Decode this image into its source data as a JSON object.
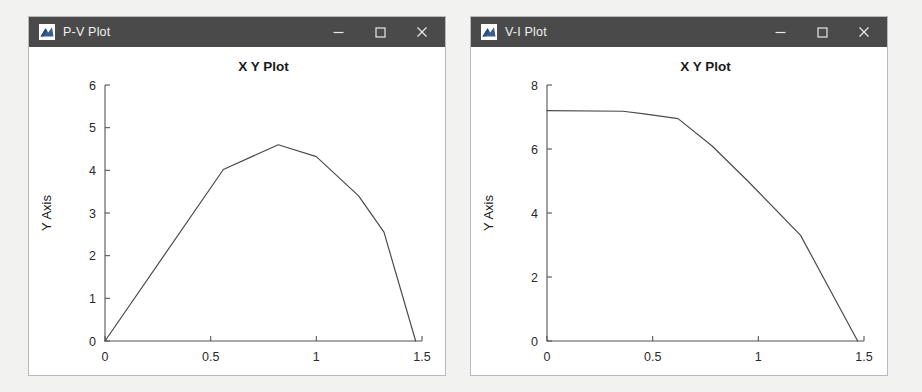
{
  "page": {
    "background_color": "#f2f2f0"
  },
  "windows": [
    {
      "id": "pv",
      "title": "P-V Plot",
      "icon": "matlab-figure-icon",
      "controls": {
        "minimize": "minimize-icon",
        "maximize": "maximize-icon",
        "close": "close-icon"
      },
      "titlebar_color": "#4a4a4a"
    },
    {
      "id": "vi",
      "title": "V-I Plot",
      "icon": "matlab-figure-icon",
      "controls": {
        "minimize": "minimize-icon",
        "maximize": "maximize-icon",
        "close": "close-icon"
      },
      "titlebar_color": "#4a4a4a"
    }
  ],
  "chart_data": [
    {
      "type": "line",
      "window": "P-V Plot",
      "title": "X Y Plot",
      "xlabel": "X Axis",
      "ylabel": "Y Axis",
      "xlim": [
        0,
        1.5
      ],
      "ylim": [
        0,
        6
      ],
      "xticks": [
        0,
        0.5,
        1,
        1.5
      ],
      "xtick_labels": [
        "0",
        "0.5",
        "1",
        "1.5"
      ],
      "yticks": [
        0,
        1,
        2,
        3,
        4,
        5,
        6
      ],
      "ytick_labels": [
        "0",
        "1",
        "2",
        "3",
        "4",
        "5",
        "6"
      ],
      "grid": false,
      "legend": false,
      "line_color": "#4b4b4b",
      "x": [
        0,
        0.56,
        0.82,
        1.0,
        1.2,
        1.32,
        1.47
      ],
      "y": [
        0,
        4.02,
        4.6,
        4.32,
        3.4,
        2.55,
        0
      ]
    },
    {
      "type": "line",
      "window": "V-I Plot",
      "title": "X Y Plot",
      "xlabel": "X Axis",
      "ylabel": "Y Axis",
      "xlim": [
        0,
        1.5
      ],
      "ylim": [
        0,
        8
      ],
      "xticks": [
        0,
        0.5,
        1,
        1.5
      ],
      "xtick_labels": [
        "0",
        "0.5",
        "1",
        "1.5"
      ],
      "yticks": [
        0,
        2,
        4,
        6,
        8
      ],
      "ytick_labels": [
        "0",
        "2",
        "4",
        "6",
        "8"
      ],
      "grid": false,
      "legend": false,
      "line_color": "#4b4b4b",
      "x": [
        0,
        0.36,
        0.46,
        0.62,
        0.78,
        0.95,
        1.2,
        1.47
      ],
      "y": [
        7.2,
        7.18,
        7.1,
        6.95,
        6.1,
        5.0,
        3.3,
        0
      ]
    }
  ]
}
